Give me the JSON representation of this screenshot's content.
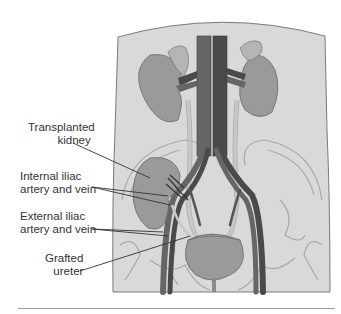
{
  "figure": {
    "type": "anatomical-diagram",
    "colors": {
      "body_fill": "#d9d9d9",
      "body_outline": "#7a7a7a",
      "organ_fill": "#9a9a9a",
      "organ_light": "#b5b5b5",
      "vessel_dark": "#4a4a4a",
      "vessel_mid": "#666666",
      "ureter": "#c8c8c8",
      "bone_line": "#a8a8a8",
      "leader": "#333333",
      "rule": "#9a9a9a"
    }
  },
  "labels": [
    {
      "id": "transplanted-kidney",
      "lines": [
        "Transplanted",
        "kidney"
      ]
    },
    {
      "id": "internal-iliac",
      "lines": [
        "Internal iliac",
        "artery and vein"
      ]
    },
    {
      "id": "external-iliac",
      "lines": [
        "External iliac",
        "artery and vein"
      ]
    },
    {
      "id": "grafted-ureter",
      "lines": [
        "Grafted",
        "ureter"
      ]
    }
  ]
}
